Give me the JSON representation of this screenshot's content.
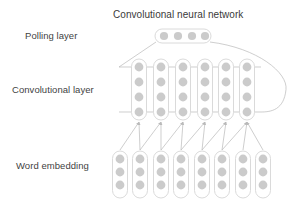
{
  "figure": {
    "title": "Convolutional neural network",
    "labels": {
      "pooling": "Polling layer",
      "convolutional": "Convolutional layer",
      "word_embedding": "Word embedding"
    }
  },
  "colors": {
    "node_fill": "#cbcbcb",
    "capsule_stroke": "#d6d6d6",
    "capsule_fill": "#ffffff",
    "edge": "#b9b9b9",
    "text": "#3f3f3f",
    "background": "#ffffff"
  },
  "architecture": {
    "pooling_layer": {
      "orientation": "horizontal",
      "columns": 1,
      "nodes": 4,
      "capsule": {
        "x": 155,
        "y": 29,
        "width": 56,
        "height": 14,
        "radius": 7
      },
      "node_positions": [
        {
          "cx": 164,
          "cy": 36
        },
        {
          "cx": 178,
          "cy": 36
        },
        {
          "cx": 192,
          "cy": 36
        },
        {
          "cx": 205,
          "cy": 36
        }
      ],
      "node_radius": 4.1
    },
    "convolutional_layer": {
      "orientation": "vertical",
      "columns": 6,
      "nodes_per_column": 4,
      "column_x": [
        139,
        161,
        183,
        205,
        226,
        247
      ],
      "row_y": [
        67,
        82,
        97,
        112
      ],
      "capsule": {
        "y": 59,
        "width": 15,
        "height": 61,
        "radius": 7.5
      },
      "node_radius": 4.4,
      "rail_rows": [
        67,
        112
      ]
    },
    "word_embedding_layer": {
      "orientation": "vertical",
      "columns": 8,
      "nodes_per_column": 3,
      "column_x": [
        120,
        140,
        161,
        181,
        202,
        222,
        243,
        263
      ],
      "row_y": [
        159,
        172,
        185
      ],
      "capsule": {
        "y": 151,
        "width": 15,
        "height": 47,
        "radius": 7.5
      },
      "node_radius": 4.4
    },
    "embedding_to_conv_edges": [
      {
        "from_col": 0,
        "to_col": 0
      },
      {
        "from_col": 1,
        "to_col": 0
      },
      {
        "from_col": 1,
        "to_col": 1
      },
      {
        "from_col": 2,
        "to_col": 1
      },
      {
        "from_col": 2,
        "to_col": 2
      },
      {
        "from_col": 3,
        "to_col": 2
      },
      {
        "from_col": 3,
        "to_col": 3
      },
      {
        "from_col": 4,
        "to_col": 3
      },
      {
        "from_col": 4,
        "to_col": 4
      },
      {
        "from_col": 5,
        "to_col": 4
      },
      {
        "from_col": 5,
        "to_col": 5
      },
      {
        "from_col": 6,
        "to_col": 5
      },
      {
        "from_col": 7,
        "to_col": 5
      }
    ],
    "conv_to_pooling_edges": [
      {
        "type": "line",
        "description": "left diagonal from conv top-left rail to pooling left end"
      },
      {
        "type": "curve",
        "description": "right sweeping arc from pooling right end around to conv bottom-right rail"
      }
    ]
  }
}
